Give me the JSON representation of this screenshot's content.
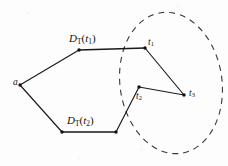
{
  "figure": {
    "canvas": {
      "width": 228,
      "height": 166,
      "background": "#fdfdfd"
    },
    "stroke_color": "#1a1a1a",
    "dash_color": "#3a3a3a",
    "labels": {
      "source": "a",
      "upper_region": {
        "base": "D",
        "sub": "T",
        "open": "(",
        "arg": "t",
        "arg_sub": "1",
        "close": ")"
      },
      "lower_region": {
        "base": "D",
        "sub": "T",
        "open": "(",
        "arg": "t",
        "arg_sub": "2",
        "close": ")"
      },
      "target_1": {
        "base": "t",
        "sub": "1"
      },
      "target_2": {
        "base": "t",
        "sub": "2"
      },
      "target_3": {
        "base": "t",
        "sub": "3"
      }
    },
    "vertices": [
      {
        "name": "a",
        "x": 20,
        "y": 85
      },
      {
        "name": "upper-left-corner",
        "x": 79,
        "y": 50
      },
      {
        "name": "t1",
        "x": 145,
        "y": 48
      },
      {
        "name": "t3",
        "x": 184,
        "y": 95
      },
      {
        "name": "t2",
        "x": 139,
        "y": 87
      },
      {
        "name": "lower-right-corner",
        "x": 116,
        "y": 132
      },
      {
        "name": "lower-left-corner",
        "x": 62,
        "y": 132
      }
    ],
    "edges": [
      {
        "from": "a",
        "to": "upper-left-corner"
      },
      {
        "from": "upper-left-corner",
        "to": "t1"
      },
      {
        "from": "t1",
        "to": "t3"
      },
      {
        "from": "t3",
        "to": "t2"
      },
      {
        "from": "t2",
        "to": "lower-right-corner"
      },
      {
        "from": "lower-right-corner",
        "to": "lower-left-corner"
      },
      {
        "from": "lower-left-corner",
        "to": "a"
      }
    ],
    "ellipse": {
      "cx": 171,
      "cy": 83,
      "rx": 51,
      "ry": 71,
      "rotation": -8,
      "style": "dashed",
      "dash": "6 5"
    }
  }
}
